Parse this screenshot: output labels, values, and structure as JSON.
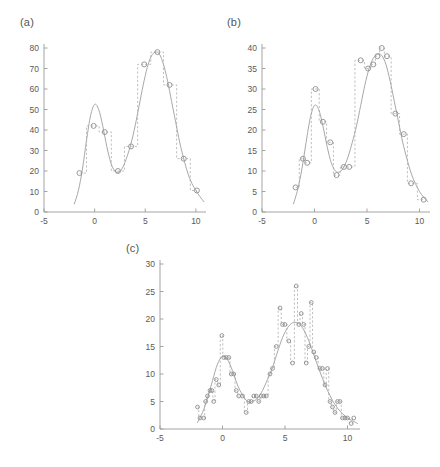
{
  "figure": {
    "type": "multi-panel-scatter-step",
    "background": "#ffffff",
    "curve_color": "#a8a8a8",
    "step_color": "#b4b4b4",
    "marker_color": "#8e8e8e",
    "axis_color": "#9a9a9a",
    "width": 440,
    "height": 467
  },
  "panels": [
    {
      "id": "a",
      "label": "(a)"
    },
    {
      "id": "b",
      "label": "(b)"
    },
    {
      "id": "c",
      "label": "(c)"
    }
  ],
  "chart_data": [
    {
      "type": "scatter",
      "panel": "a",
      "title": "(a)",
      "xlabel": "",
      "ylabel": "",
      "xlim": [
        -5,
        11
      ],
      "ylim": [
        0,
        80
      ],
      "xticks": [
        -5,
        0,
        5,
        10
      ],
      "xticklabels": [
        "-5",
        "0",
        "5",
        "10"
      ],
      "yticks": [
        0,
        10,
        20,
        30,
        40,
        50,
        60,
        70,
        80
      ],
      "yticklabels": [
        "0",
        "10",
        "20",
        "30",
        "40",
        "50",
        "60",
        "70",
        "80"
      ],
      "grid": false,
      "legend": null,
      "series": [
        {
          "name": "intensity function",
          "style": "solid-curve",
          "x": [
            -2.0,
            -1.6,
            -1.2,
            -0.8,
            -0.4,
            0.0,
            0.4,
            0.8,
            1.2,
            1.6,
            2.0,
            2.4,
            2.8,
            3.2,
            3.6,
            4.0,
            4.4,
            4.8,
            5.2,
            5.6,
            6.0,
            6.4,
            6.8,
            7.2,
            7.6,
            8.0,
            8.4,
            8.8,
            9.2,
            9.6,
            10.0,
            10.4,
            10.8
          ],
          "y": [
            4.0,
            10.5,
            21.0,
            35.0,
            47.0,
            52.5,
            50.0,
            42.0,
            32.0,
            24.0,
            20.0,
            19.5,
            22.0,
            27.0,
            33.5,
            42.0,
            52.0,
            62.0,
            70.5,
            76.0,
            78.0,
            77.0,
            72.0,
            64.0,
            54.0,
            44.0,
            34.0,
            26.0,
            19.0,
            14.0,
            10.5,
            7.5,
            5.0
          ]
        },
        {
          "name": "observed counts",
          "style": "step-dashed-with-circles",
          "x": [
            -1.5,
            -0.1,
            1.0,
            2.3,
            3.6,
            4.9,
            6.2,
            7.4,
            8.8,
            10.1
          ],
          "y": [
            19,
            42,
            39,
            20,
            32,
            72,
            78,
            62,
            26,
            10.5
          ]
        }
      ]
    },
    {
      "type": "scatter",
      "panel": "b",
      "title": "(b)",
      "xlabel": "",
      "ylabel": "",
      "xlim": [
        -5,
        11
      ],
      "ylim": [
        0,
        40
      ],
      "xticks": [
        -5,
        0,
        5,
        10
      ],
      "xticklabels": [
        "-5",
        "0",
        "5",
        "10"
      ],
      "yticks": [
        0,
        5,
        10,
        15,
        20,
        25,
        30,
        35,
        40
      ],
      "yticklabels": [
        "0",
        "5",
        "10",
        "15",
        "20",
        "25",
        "30",
        "35",
        "40"
      ],
      "grid": false,
      "legend": null,
      "series": [
        {
          "name": "intensity function",
          "style": "solid-curve",
          "x": [
            -2.0,
            -1.6,
            -1.2,
            -0.8,
            -0.4,
            0.0,
            0.4,
            0.8,
            1.2,
            1.6,
            2.0,
            2.4,
            2.8,
            3.2,
            3.6,
            4.0,
            4.4,
            4.8,
            5.2,
            5.6,
            6.0,
            6.4,
            6.8,
            7.2,
            7.6,
            8.0,
            8.4,
            8.8,
            9.2,
            9.6,
            10.0,
            10.4,
            10.8
          ],
          "y": [
            2.0,
            5.5,
            10.5,
            17.0,
            23.0,
            26.0,
            25.0,
            21.0,
            16.0,
            12.0,
            10.0,
            9.8,
            11.0,
            13.5,
            17.0,
            21.0,
            26.0,
            31.0,
            35.0,
            37.5,
            38.5,
            38.2,
            36.0,
            32.0,
            27.0,
            22.0,
            17.0,
            13.0,
            9.5,
            7.0,
            5.0,
            3.6,
            2.5
          ]
        },
        {
          "name": "observed counts",
          "style": "step-dashed-with-circles",
          "x": [
            -1.8,
            -1.1,
            -0.7,
            0.1,
            0.8,
            1.5,
            2.1,
            2.8,
            3.3,
            4.4,
            5.1,
            5.6,
            6.0,
            6.4,
            6.9,
            7.7,
            8.5,
            9.2,
            10.4
          ],
          "y": [
            6,
            13,
            12,
            30,
            22,
            17,
            9,
            11,
            11,
            37,
            35,
            36,
            38,
            40,
            38,
            24,
            19,
            7,
            3
          ]
        }
      ]
    },
    {
      "type": "scatter",
      "panel": "c",
      "title": "(c)",
      "xlabel": "",
      "ylabel": "",
      "xlim": [
        -5,
        11
      ],
      "ylim": [
        0,
        30
      ],
      "xticks": [
        -5,
        0,
        5,
        10
      ],
      "xticklabels": [
        "-5",
        "0",
        "5",
        "10"
      ],
      "yticks": [
        0,
        5,
        10,
        15,
        20,
        25,
        30
      ],
      "yticklabels": [
        "0",
        "5",
        "10",
        "15",
        "20",
        "25",
        "30"
      ],
      "grid": false,
      "legend": null,
      "series": [
        {
          "name": "intensity function",
          "style": "solid-curve",
          "x": [
            -2.0,
            -1.6,
            -1.2,
            -0.8,
            -0.4,
            0.0,
            0.4,
            0.8,
            1.2,
            1.6,
            2.0,
            2.4,
            2.8,
            3.2,
            3.6,
            4.0,
            4.4,
            4.8,
            5.2,
            5.6,
            6.0,
            6.4,
            6.8,
            7.2,
            7.6,
            8.0,
            8.4,
            8.8,
            9.2,
            9.6,
            10.0,
            10.4,
            10.8
          ],
          "y": [
            1.2,
            3.0,
            5.6,
            8.8,
            11.8,
            13.2,
            12.6,
            10.6,
            8.0,
            6.2,
            5.0,
            5.0,
            5.6,
            7.0,
            9.0,
            11.2,
            14.0,
            16.6,
            18.4,
            19.3,
            19.3,
            18.4,
            16.6,
            14.2,
            11.6,
            9.2,
            7.0,
            5.2,
            3.8,
            2.8,
            2.0,
            1.5,
            1.0
          ]
        },
        {
          "name": "observed counts",
          "style": "step-dashed-with-circles",
          "x": [
            -2.0,
            -1.8,
            -1.5,
            -1.35,
            -1.2,
            -1.0,
            -0.85,
            -0.7,
            -0.5,
            -0.3,
            -0.05,
            0.1,
            0.3,
            0.5,
            0.7,
            0.9,
            1.1,
            1.3,
            1.6,
            1.9,
            2.1,
            2.3,
            2.5,
            2.7,
            2.9,
            3.1,
            3.3,
            3.5,
            3.8,
            4.0,
            4.3,
            4.6,
            4.8,
            5.0,
            5.3,
            5.6,
            5.9,
            6.1,
            6.3,
            6.5,
            6.7,
            6.9,
            7.1,
            7.3,
            7.5,
            7.8,
            8.0,
            8.2,
            8.4,
            8.6,
            8.8,
            9.0,
            9.2,
            9.4,
            9.6,
            9.8,
            10.0,
            10.3,
            10.5
          ],
          "y": [
            4,
            2,
            2,
            5,
            6,
            7,
            7,
            5,
            9,
            8,
            17,
            13,
            13,
            13,
            10,
            10,
            7,
            6,
            6,
            3,
            5,
            5,
            6,
            6,
            5,
            6,
            6,
            6,
            10,
            11,
            15,
            22,
            19,
            19,
            16,
            12,
            26,
            19,
            21,
            19,
            12,
            15,
            23,
            14,
            13,
            11,
            11,
            8,
            11,
            5,
            4,
            3,
            5,
            5,
            2,
            2,
            2,
            1,
            2
          ]
        }
      ]
    }
  ]
}
